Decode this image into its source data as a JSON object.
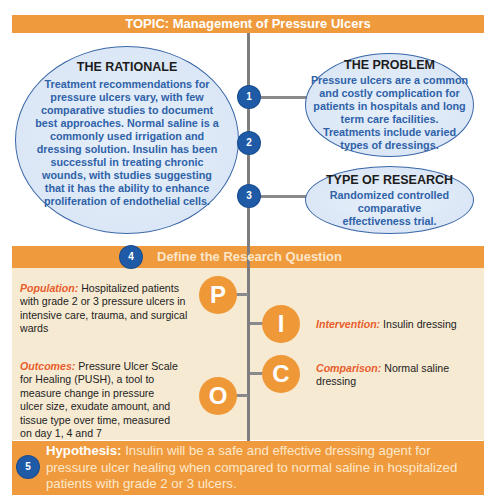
{
  "topic": {
    "label": "TOPIC: Management of Pressure Ulcers"
  },
  "steps": [
    {
      "number": "1"
    },
    {
      "number": "2"
    },
    {
      "number": "3"
    },
    {
      "number": "4"
    },
    {
      "number": "5"
    }
  ],
  "rationale": {
    "title": "THE RATIONALE",
    "body": "Treatment recommendations for pressure ulcers vary, with few comparative studies to document best approaches. Normal saline is a commonly used irrigation and dressing solution. Insulin has been successful in treating chronic wounds, with studies suggesting that it has the ability to enhance proliferation of endothelial cells."
  },
  "problem": {
    "title": "THE PROBLEM",
    "body": "Pressure ulcers are a common and costly complication for patients in hospitals and long term care facilities. Treatments include varied types of dressings."
  },
  "research_type": {
    "title": "TYPE OF RESEARCH",
    "body": "Randomized controlled comparative effectiveness trial."
  },
  "research_question": {
    "title": "Define the Research Question"
  },
  "pico": {
    "population": {
      "letter": "P",
      "label": "Population:",
      "text": " Hospitalized patients with grade 2 or 3 pressure ulcers in intensive care, trauma, and surgical wards"
    },
    "intervention": {
      "letter": "I",
      "label": "Intervention:",
      "text": " Insulin dressing"
    },
    "comparison": {
      "letter": "C",
      "label": "Comparison:",
      "text": " Normal saline dressing"
    },
    "outcomes": {
      "letter": "O",
      "label": "Outcomes:",
      "text": " Pressure Ulcer Scale for Healing (PUSH), a tool to measure change in pressure ulcer size, exudate amount, and tissue type over time, measured on day 1, 4 and 7"
    }
  },
  "hypothesis": {
    "label": "Hypothesis:",
    "text": " Insulin will be a safe and effective dressing agent for pressure ulcer healing when compared to normal saline in hospitalized patients with grade 2 or 3 ulcers."
  },
  "colors": {
    "orange": "#ef9a3c",
    "beige": "#f7ead2",
    "blue_circle": "#1f5aa6",
    "ellipse_text": "#2f62a8",
    "pico_label": "#e85d2c",
    "connector": "#7d7d80"
  }
}
